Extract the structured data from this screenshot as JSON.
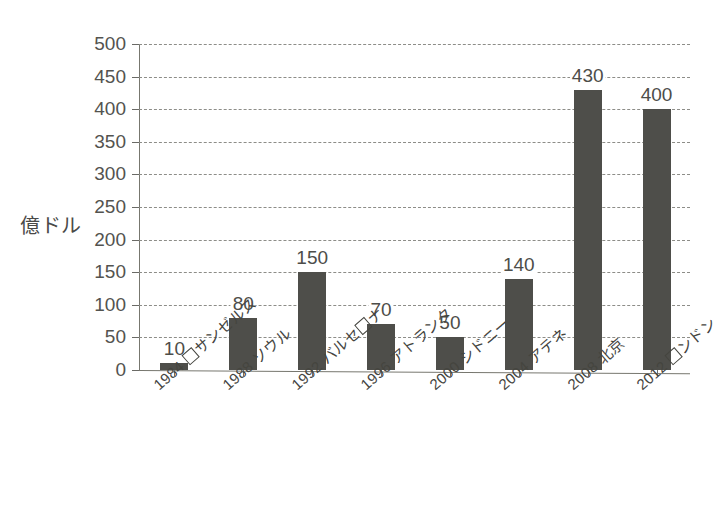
{
  "chart_data": {
    "type": "bar",
    "title": "",
    "xlabel": "",
    "ylabel": "億ドル",
    "ylim": [
      0,
      500
    ],
    "y_ticks": [
      0,
      50,
      100,
      150,
      200,
      250,
      300,
      350,
      400,
      450,
      500
    ],
    "grid": true,
    "legend": "none",
    "categories": [
      "1984 ロサンゼルス",
      "1988 ソウル",
      "1992 バルセロナ",
      "1996 アトランタ",
      "2000 シドニー",
      "2004 アテネ",
      "2008 北京",
      "2012 ロンドン"
    ],
    "values": [
      10,
      80,
      150,
      70,
      50,
      140,
      430,
      400
    ],
    "bar_color": "#4e4e4a",
    "data_labels": [
      "10",
      "80",
      "150",
      "70",
      "50",
      "140",
      "430",
      "400"
    ]
  },
  "axis": {
    "y_title": "億ドル",
    "tick_labels": [
      "500",
      "450",
      "400",
      "350",
      "300",
      "250",
      "200",
      "150",
      "100",
      "50",
      "0"
    ],
    "category_labels": [
      {
        "year": "1984",
        "city_pre": "",
        "city_post": "サンゼルス",
        "has_box": true,
        "box_index": 0,
        "full": "1984 ロサンゼルス"
      },
      {
        "year": "1988",
        "city_pre": "ソウル",
        "city_post": "",
        "has_box": false,
        "full": "1988 ソウル"
      },
      {
        "year": "1992",
        "city_pre": "バルセ",
        "city_post": "ナ",
        "has_box": true,
        "box_index": 1,
        "full": "1992 バルセロナ"
      },
      {
        "year": "1996",
        "city_pre": "アトランタ",
        "city_post": "",
        "has_box": false,
        "full": "1996 アトランタ"
      },
      {
        "year": "2000",
        "city_pre": "シドニー",
        "city_post": "",
        "has_box": false,
        "full": "2000 シドニー"
      },
      {
        "year": "2004",
        "city_pre": "アテネ",
        "city_post": "",
        "has_box": false,
        "full": "2004 アテネ"
      },
      {
        "year": "2008",
        "city_pre": "北京",
        "city_post": "",
        "has_box": false,
        "full": "2008 北京"
      },
      {
        "year": "2012",
        "city_pre": "",
        "city_post": "ンドン",
        "has_box": true,
        "box_index": 0,
        "full": "2012 ロンドン"
      }
    ]
  },
  "colors": {
    "bar": "#4e4e4a",
    "axis": "#77776f",
    "grid": "#8d8d88",
    "text": "#45453f",
    "background": "#ffffff"
  }
}
